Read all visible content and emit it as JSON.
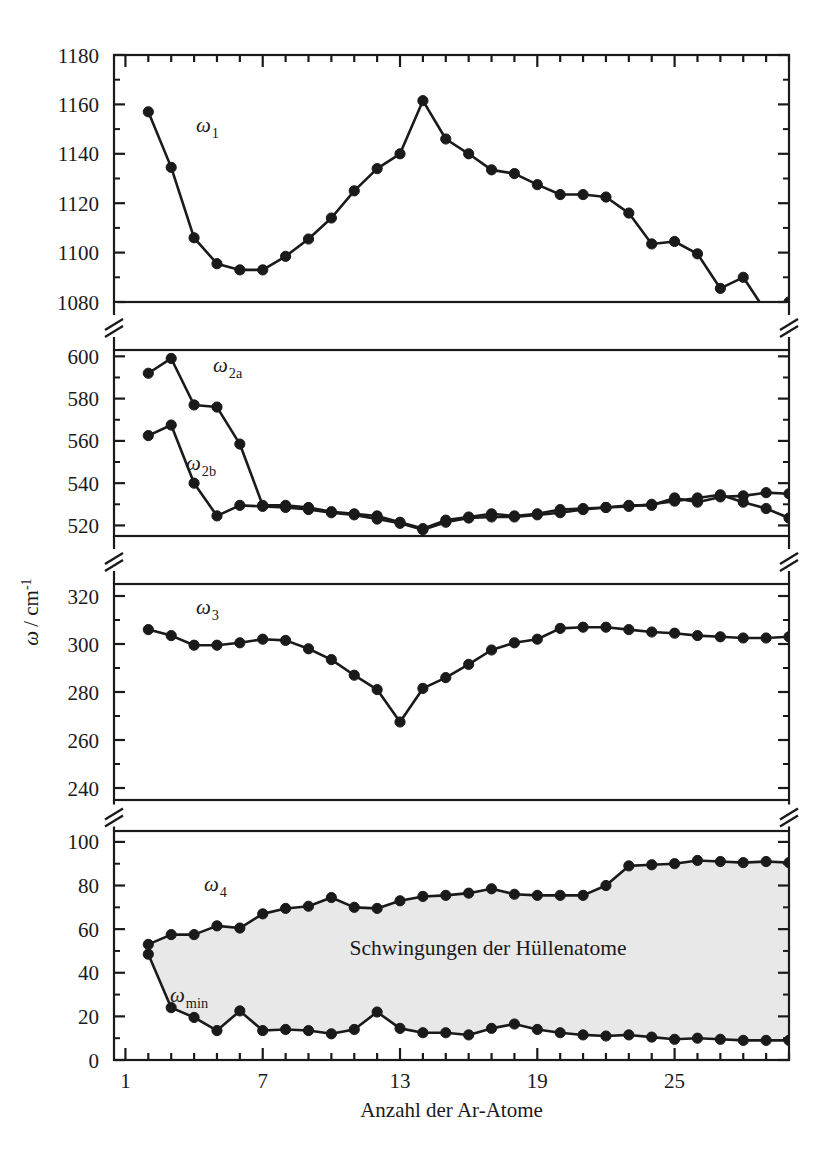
{
  "figure": {
    "xlabel": "Anzahl der Ar-Atome",
    "ylabel_omega": "ω",
    "ylabel_unit": "/ cm",
    "ylabel_exp": "-1",
    "shaded_region_label": "Schwingungen der Hüllenatome",
    "series_labels": {
      "w1": "ω",
      "w1_sub": "1",
      "w2a": "ω",
      "w2a_sub": "2a",
      "w2b": "ω",
      "w2b_sub": "2b",
      "w3": "ω",
      "w3_sub": "3",
      "w4": "ω",
      "w4_sub": "4",
      "wmin": "ω",
      "wmin_sub": "min"
    },
    "marker_color": "#1a1a1a",
    "line_color": "#1a1a1a",
    "shade_color": "#e8e8e8",
    "axis_color": "#1a1a1a"
  },
  "chart_data": {
    "type": "line",
    "title": "",
    "xlabel": "Anzahl der Ar-Atome",
    "ylabel": "ω / cm^-1",
    "xlim": [
      0.5,
      30.0
    ],
    "xticks": [
      1,
      7,
      13,
      19,
      25
    ],
    "xticklabels": [
      "1",
      "7",
      "13",
      "19",
      "25"
    ],
    "xminor_step": 1,
    "grid": false,
    "legend": "inline-annotations",
    "broken_axis": true,
    "panels": [
      {
        "name": "panel-omega1",
        "ylim": [
          1080,
          1180
        ],
        "yticks": [
          1080,
          1100,
          1120,
          1140,
          1160,
          1180
        ],
        "yticklabels": [
          "1080",
          "1100",
          "1120",
          "1140",
          "1160",
          "1180"
        ],
        "series": [
          {
            "name": "ω₁",
            "key": "w1",
            "x": [
              2,
              3,
              4,
              5,
              6,
              7,
              8,
              9,
              10,
              11,
              12,
              13,
              14,
              15,
              16,
              17,
              18,
              19,
              20,
              21,
              22,
              23,
              24,
              25,
              26,
              27,
              28,
              29,
              30
            ],
            "values": [
              1157,
              1134.5,
              1106,
              1095.5,
              1093,
              1093,
              1098.5,
              1105.5,
              1114,
              1125,
              1134,
              1140,
              1161.5,
              1146,
              1140,
              1133.5,
              1132,
              1127.5,
              1123.5,
              1123.5,
              1122.5,
              1116,
              1103.5,
              1104.5,
              1099.5,
              1085.5,
              1090,
              1076,
              1080
            ]
          }
        ]
      },
      {
        "name": "panel-omega2",
        "ylim": [
          515,
          603
        ],
        "yticks": [
          520,
          540,
          560,
          580,
          600
        ],
        "yticklabels": [
          "520",
          "540",
          "560",
          "580",
          "600"
        ],
        "series": [
          {
            "name": "ω₂ₐ",
            "key": "w2a",
            "x": [
              2,
              3,
              4,
              5,
              6,
              7,
              8,
              9,
              10,
              11,
              12,
              13,
              14,
              15,
              16,
              17,
              18,
              19,
              20,
              21,
              22,
              23,
              24,
              25,
              26,
              27,
              28,
              29,
              30
            ],
            "values": [
              592,
              599,
              577,
              576,
              558.5,
              529.5,
              529.5,
              528.5,
              526.5,
              525.5,
              524.5,
              521.5,
              518.5,
              522.5,
              524,
              525.5,
              524.5,
              525.5,
              527.5,
              528,
              528.5,
              529.5,
              529.5,
              533,
              531,
              533.5,
              534,
              535.5,
              535
            ]
          },
          {
            "name": "ω₂ᵇ",
            "key": "w2b",
            "x": [
              2,
              3,
              4,
              5,
              6,
              7,
              8,
              9,
              10,
              11,
              12,
              13,
              14,
              15,
              16,
              17,
              18,
              19,
              20,
              21,
              22,
              23,
              24,
              25,
              26,
              27,
              28,
              29,
              30
            ],
            "values": [
              562.5,
              567.5,
              540,
              524.5,
              529.5,
              529,
              528.5,
              527.5,
              526,
              525,
              523,
              521,
              518,
              521.5,
              523.5,
              524,
              524,
              525,
              526,
              527.5,
              528.5,
              529,
              530,
              531.5,
              533,
              534.5,
              531,
              528,
              523.5
            ]
          }
        ]
      },
      {
        "name": "panel-omega3",
        "ylim": [
          235,
          325
        ],
        "yticks": [
          240,
          260,
          280,
          300,
          320
        ],
        "yticklabels": [
          "240",
          "260",
          "280",
          "300",
          "320"
        ],
        "series": [
          {
            "name": "ω₃",
            "key": "w3",
            "x": [
              2,
              3,
              4,
              5,
              6,
              7,
              8,
              9,
              10,
              11,
              12,
              13,
              14,
              15,
              16,
              17,
              18,
              19,
              20,
              21,
              22,
              23,
              24,
              25,
              26,
              27,
              28,
              29,
              30
            ],
            "values": [
              306,
              303.5,
              299.5,
              299.5,
              300.5,
              302,
              301.5,
              298,
              293.5,
              287,
              281,
              267.5,
              281.5,
              286,
              291.5,
              297.5,
              300.5,
              302,
              306.5,
              307,
              307,
              306,
              305,
              304.5,
              303.5,
              303,
              302.5,
              302.5,
              303
            ]
          }
        ]
      },
      {
        "name": "panel-omega4",
        "ylim": [
          0,
          105
        ],
        "yticks": [
          0,
          20,
          40,
          60,
          80,
          100
        ],
        "yticklabels": [
          "0",
          "20",
          "40",
          "60",
          "80",
          "100"
        ],
        "shaded_between": [
          "w4",
          "wmin"
        ],
        "series": [
          {
            "name": "ω₄",
            "key": "w4",
            "x": [
              2,
              3,
              4,
              5,
              6,
              7,
              8,
              9,
              10,
              11,
              12,
              13,
              14,
              15,
              16,
              17,
              18,
              19,
              20,
              21,
              22,
              23,
              24,
              25,
              26,
              27,
              28,
              29,
              30
            ],
            "values": [
              53,
              57.5,
              57.5,
              61.5,
              60.5,
              67,
              69.5,
              70.5,
              74.5,
              70,
              69.5,
              73,
              75,
              75.5,
              76.5,
              78.5,
              76,
              75.5,
              75.5,
              75.5,
              80,
              89,
              89.5,
              90,
              91.5,
              91,
              90.5,
              91,
              90.5
            ]
          },
          {
            "name": "ωmin",
            "key": "wmin",
            "x": [
              2,
              3,
              4,
              5,
              6,
              7,
              8,
              9,
              10,
              11,
              12,
              13,
              14,
              15,
              16,
              17,
              18,
              19,
              20,
              21,
              22,
              23,
              24,
              25,
              26,
              27,
              28,
              29,
              30
            ],
            "values": [
              48.5,
              24,
              19.5,
              13.5,
              22.5,
              13.5,
              14,
              13.5,
              12,
              14,
              22,
              14.5,
              12.5,
              12.5,
              11.5,
              14.5,
              16.5,
              14,
              12.5,
              11.5,
              11,
              11.5,
              10.5,
              9.5,
              10,
              9.5,
              9,
              9,
              9
            ]
          }
        ]
      }
    ]
  }
}
